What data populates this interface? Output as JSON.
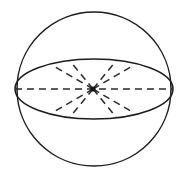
{
  "figure": {
    "kind": "geometry-diagram",
    "canvas": {
      "width": 188,
      "height": 177,
      "background": "#ffffff"
    },
    "colors": {
      "solid_stroke": "#1c1c1c",
      "dashed_stroke": "#2a2a2a",
      "center_dot": "#141414",
      "background": "#ffffff"
    },
    "stroke_width": 1.5,
    "dash_pattern": "7 5"
  },
  "shapes": {
    "sphere_outline": {
      "name": "sphere-outline-circle",
      "cx": 94,
      "cy": 89,
      "r": 77,
      "style": "solid"
    },
    "equator_ellipse": {
      "name": "equator-ellipse",
      "cx": 94,
      "cy": 89,
      "rx": 79,
      "ry": 30,
      "style": "solid"
    },
    "center_point": {
      "name": "center-point",
      "cx": 93,
      "cy": 89,
      "r": 2.6
    },
    "horizontal_diameter": {
      "name": "horizontal-diameter",
      "x1": 15,
      "y1": 89,
      "x2": 173,
      "y2": 89,
      "style": "dashed"
    },
    "radii": [
      {
        "name": "radius-upper-left",
        "x1": 93,
        "y1": 89,
        "x2": 52,
        "y2": 65
      },
      {
        "name": "radius-upper-right",
        "x1": 93,
        "y1": 89,
        "x2": 134,
        "y2": 65
      },
      {
        "name": "radius-lower-left",
        "x1": 93,
        "y1": 89,
        "x2": 52,
        "y2": 113
      },
      {
        "name": "radius-lower-right",
        "x1": 93,
        "y1": 89,
        "x2": 134,
        "y2": 113
      },
      {
        "name": "radius-upper-left-inner",
        "x1": 93,
        "y1": 89,
        "x2": 70,
        "y2": 61
      },
      {
        "name": "radius-upper-right-inner",
        "x1": 93,
        "y1": 89,
        "x2": 116,
        "y2": 61
      },
      {
        "name": "radius-lower-left-inner",
        "x1": 93,
        "y1": 89,
        "x2": 70,
        "y2": 117
      },
      {
        "name": "radius-lower-right-inner",
        "x1": 93,
        "y1": 89,
        "x2": 116,
        "y2": 117
      }
    ]
  },
  "labels": {
    "caption": ""
  }
}
